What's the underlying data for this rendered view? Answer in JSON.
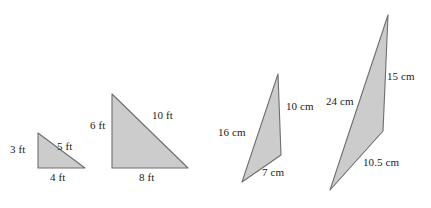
{
  "figure": {
    "background_color": "#ffffff",
    "fill_color": "#cccccc",
    "stroke_color": "#6e6e6e",
    "text_color": "#1a1a1a",
    "shapes": [
      {
        "name": "triangle-1",
        "unit": "ft",
        "points": "38,133 38,168 85,168",
        "labels": [
          {
            "name": "side-label-3ft",
            "text": "3 ft",
            "x": 10,
            "y": 144
          },
          {
            "name": "side-label-5ft",
            "text": "5 ft",
            "x": 57,
            "y": 141
          },
          {
            "name": "side-label-4ft",
            "text": "4 ft",
            "x": 50,
            "y": 172
          }
        ]
      },
      {
        "name": "triangle-2",
        "unit": "ft",
        "points": "112,94 112,168 188,168",
        "labels": [
          {
            "name": "side-label-6ft",
            "text": "6 ft",
            "x": 90,
            "y": 120
          },
          {
            "name": "side-label-10ft",
            "text": "10 ft",
            "x": 152,
            "y": 110
          },
          {
            "name": "side-label-8ft",
            "text": "8 ft",
            "x": 139,
            "y": 172
          }
        ]
      },
      {
        "name": "triangle-3",
        "unit": "cm",
        "points": "278,74 281,155 242,182",
        "labels": [
          {
            "name": "side-label-16cm",
            "text": "16 cm",
            "x": 218,
            "y": 127
          },
          {
            "name": "side-label-10cm",
            "text": "10 cm",
            "x": 286,
            "y": 101
          },
          {
            "name": "side-label-7cm",
            "text": "7 cm",
            "x": 262,
            "y": 167
          }
        ]
      },
      {
        "name": "triangle-4",
        "unit": "cm",
        "points": "388,15 383,131 330,190",
        "labels": [
          {
            "name": "side-label-24cm",
            "text": "24 cm",
            "x": 326,
            "y": 96
          },
          {
            "name": "side-label-15cm",
            "text": "15 cm",
            "x": 387,
            "y": 71
          },
          {
            "name": "side-label-10.5cm",
            "text": "10.5 cm",
            "x": 363,
            "y": 157
          }
        ]
      }
    ]
  }
}
